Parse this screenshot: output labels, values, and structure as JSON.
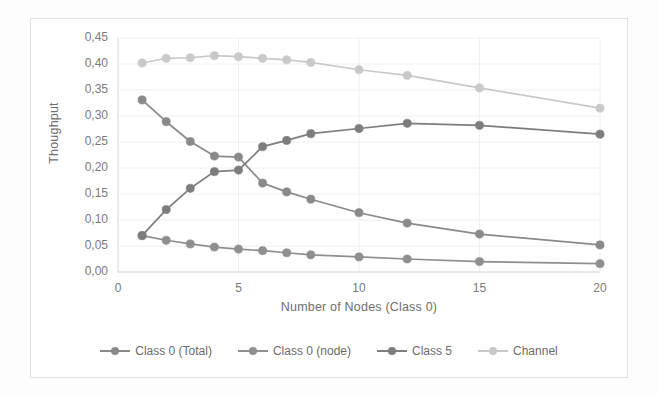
{
  "chart_data": {
    "type": "line",
    "title": "",
    "xlabel": "Number of Nodes (Class 0)",
    "ylabel": "Thoughput",
    "x": [
      1,
      2,
      3,
      4,
      5,
      6,
      7,
      8,
      10,
      12,
      15,
      20
    ],
    "xlim": [
      0,
      20
    ],
    "ylim": [
      0.0,
      0.45
    ],
    "grid": true,
    "legend_position": "bottom",
    "x_ticks": [
      "0",
      "5",
      "10",
      "15",
      "20"
    ],
    "x_tick_values": [
      0,
      5,
      10,
      15,
      20
    ],
    "y_ticks": [
      "0,00",
      "0,05",
      "0,10",
      "0,15",
      "0,20",
      "0,25",
      "0,30",
      "0,35",
      "0,40",
      "0,45"
    ],
    "y_tick_values": [
      0.0,
      0.05,
      0.1,
      0.15,
      0.2,
      0.25,
      0.3,
      0.35,
      0.4,
      0.45
    ],
    "series": [
      {
        "name": "Class 0 (Total)",
        "color": "#8a8a8a",
        "values": [
          0.331,
          0.289,
          0.251,
          0.223,
          0.221,
          0.171,
          0.154,
          0.14,
          0.114,
          0.094,
          0.073,
          0.052
        ]
      },
      {
        "name": "Class 0 (node)",
        "color": "#8f8f8f",
        "values": [
          0.07,
          0.061,
          0.054,
          0.048,
          0.044,
          0.041,
          0.037,
          0.033,
          0.029,
          0.025,
          0.02,
          0.016
        ]
      },
      {
        "name": "Class 5",
        "color": "#7d7d7d",
        "values": [
          0.07,
          0.12,
          0.161,
          0.193,
          0.196,
          0.241,
          0.253,
          0.266,
          0.276,
          0.286,
          0.282,
          0.265
        ]
      },
      {
        "name": "Channel",
        "color": "#c9c9c9",
        "values": [
          0.402,
          0.411,
          0.412,
          0.416,
          0.414,
          0.411,
          0.408,
          0.403,
          0.389,
          0.378,
          0.354,
          0.315
        ]
      }
    ]
  },
  "legend": {
    "items": [
      {
        "label": "Class 0 (Total)",
        "color": "#8a8a8a"
      },
      {
        "label": "Class 0 (node)",
        "color": "#8f8f8f"
      },
      {
        "label": "Class 5",
        "color": "#7d7d7d"
      },
      {
        "label": "Channel",
        "color": "#c9c9c9"
      }
    ]
  },
  "colors": {
    "axis": "#d8d8d8",
    "grid": "#f0f0f0",
    "tick_text": "#7a7a7a",
    "frame": "#e2e2e2",
    "background": "#ffffff"
  }
}
